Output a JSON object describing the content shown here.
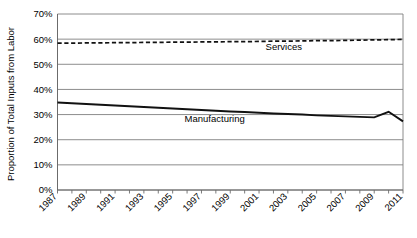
{
  "chart_data": {
    "type": "line",
    "title": "",
    "xlabel": "",
    "ylabel": "Proportion of Total Inputs from Labor",
    "ylim": [
      0,
      70
    ],
    "ytick_labels": [
      "0%",
      "10%",
      "20%",
      "30%",
      "40%",
      "50%",
      "60%",
      "70%"
    ],
    "ytick_values": [
      0,
      10,
      20,
      30,
      40,
      50,
      60,
      70
    ],
    "xlim": [
      1987,
      2011
    ],
    "xtick_labels": [
      "1987",
      "1989",
      "1991",
      "1993",
      "1995",
      "1997",
      "1999",
      "2001",
      "2003",
      "2005",
      "2007",
      "2009",
      "2011"
    ],
    "xtick_values": [
      1987,
      1989,
      1991,
      1993,
      1995,
      1997,
      1999,
      2001,
      2003,
      2005,
      2007,
      2009,
      2011
    ],
    "minor_xticks": [
      1987,
      1988,
      1989,
      1990,
      1991,
      1992,
      1993,
      1994,
      1995,
      1996,
      1997,
      1998,
      1999,
      2000,
      2001,
      2002,
      2003,
      2004,
      2005,
      2006,
      2007,
      2008,
      2009,
      2010,
      2011
    ],
    "grid": true,
    "legend_position": "inline-annotations",
    "x": [
      1987,
      1988,
      1989,
      1990,
      1991,
      1992,
      1993,
      1994,
      1995,
      1996,
      1997,
      1998,
      1999,
      2000,
      2001,
      2002,
      2003,
      2004,
      2005,
      2006,
      2007,
      2008,
      2009,
      2010,
      2011
    ],
    "series": [
      {
        "name": "Services",
        "style": "dashed",
        "color": "#111111",
        "label_text": "Services",
        "values": [
          58.4,
          58.4,
          58.5,
          58.5,
          58.6,
          58.6,
          58.7,
          58.7,
          58.8,
          58.8,
          58.9,
          58.9,
          59.0,
          59.0,
          59.1,
          59.2,
          59.2,
          59.3,
          59.4,
          59.4,
          59.5,
          59.6,
          59.7,
          59.8,
          59.9
        ]
      },
      {
        "name": "Manufacturing",
        "style": "solid",
        "color": "#111111",
        "label_text": "Manufacturing",
        "values": [
          34.8,
          34.5,
          34.2,
          33.9,
          33.6,
          33.3,
          33.0,
          32.7,
          32.4,
          32.1,
          31.8,
          31.5,
          31.2,
          31.0,
          30.7,
          30.4,
          30.2,
          30.0,
          29.7,
          29.5,
          29.3,
          29.1,
          28.9,
          31.1,
          27.3
        ]
      }
    ],
    "annotations": [
      {
        "name": "services-label",
        "text": "Services",
        "x_frac": 0.655,
        "y_pct": 55.6
      },
      {
        "name": "manufacturing-label",
        "text": "Manufacturing",
        "x_frac": 0.455,
        "y_pct": 27.1
      }
    ]
  },
  "footer": {
    "cut_caption": ""
  }
}
